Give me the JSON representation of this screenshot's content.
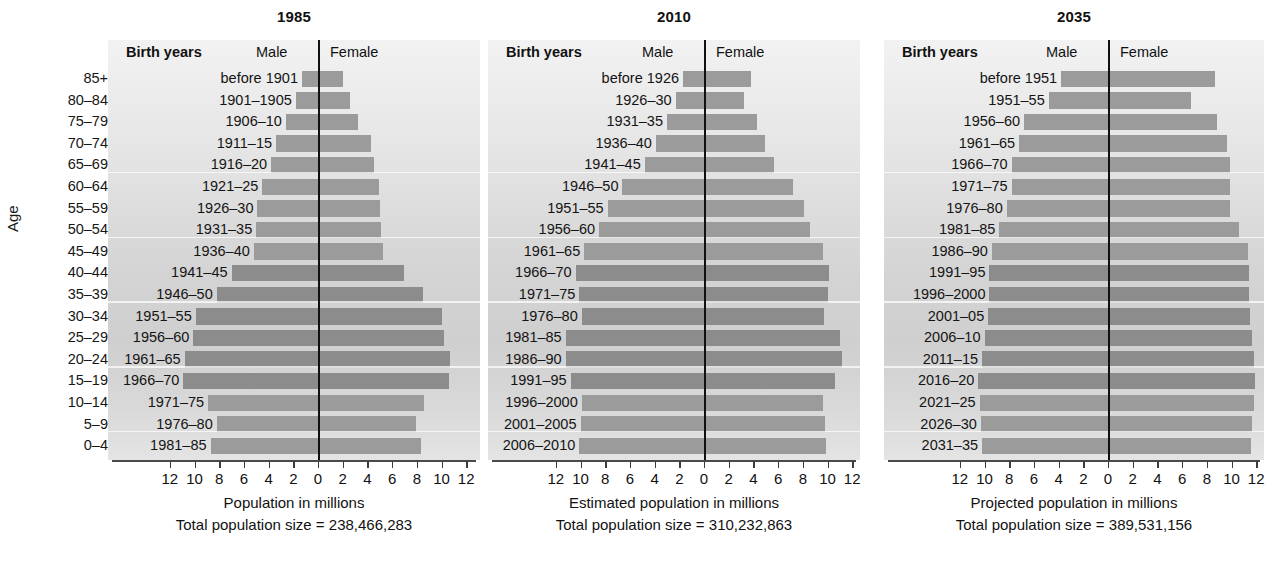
{
  "y_axis": {
    "title": "Age",
    "labels": [
      "85+",
      "80–84",
      "75–79",
      "70–74",
      "65–69",
      "60–64",
      "55–59",
      "50–54",
      "45–49",
      "40–44",
      "35–39",
      "30–34",
      "25–29",
      "20–24",
      "15–19",
      "10–14",
      "5–9",
      "0–4"
    ]
  },
  "common": {
    "birth_years_header": "Birth years",
    "male_header": "Male",
    "female_header": "Female",
    "tick_labels": [
      "12",
      "10",
      "8",
      "6",
      "4",
      "2",
      "0",
      "2",
      "4",
      "6",
      "8",
      "10",
      "12"
    ],
    "bar_color": "#9b9b9b",
    "bar_color_dark": "#8c8c8c",
    "zero_line_color": "#111111"
  },
  "chart_data": {
    "type": "bar",
    "ylabel": "Age",
    "grid": true,
    "legend": [
      "Male",
      "Female"
    ],
    "xlim": [
      -12,
      12
    ],
    "categories": [
      "85+",
      "80–84",
      "75–79",
      "70–74",
      "65–69",
      "60–64",
      "55–59",
      "50–54",
      "45–49",
      "40–44",
      "35–39",
      "30–34",
      "25–29",
      "20–24",
      "15–19",
      "10–14",
      "5–9",
      "0–4"
    ],
    "panels": [
      {
        "year": "1985",
        "xlabel": "Population in millions",
        "total_label": "Total population size = 238,466,283",
        "total_value": 238466283,
        "birth_years": [
          "before 1901",
          "1901–1905",
          "1906–10",
          "1911–15",
          "1916–20",
          "1921–25",
          "1926–30",
          "1931–35",
          "1936–40",
          "1941–45",
          "1946–50",
          "1951–55",
          "1956–60",
          "1961–65",
          "1966–70",
          "1971–75",
          "1976–80",
          "1981–85"
        ],
        "male": [
          1.3,
          1.8,
          2.6,
          3.4,
          3.8,
          4.5,
          4.9,
          5.0,
          5.2,
          7.0,
          8.2,
          9.9,
          10.1,
          10.8,
          10.9,
          8.9,
          8.2,
          8.7
        ],
        "female": [
          2.0,
          2.6,
          3.2,
          4.3,
          4.5,
          4.9,
          5.0,
          5.1,
          5.3,
          7.0,
          8.5,
          10.0,
          10.2,
          10.7,
          10.6,
          8.6,
          7.9,
          8.3
        ],
        "highlight_rows": [
          9,
          10,
          11,
          12,
          13,
          14
        ]
      },
      {
        "year": "2010",
        "xlabel": "Estimated population in millions",
        "total_label": "Total population size = 310,232,863",
        "total_value": 310232863,
        "birth_years": [
          "before 1926",
          "1926–30",
          "1931–35",
          "1936–40",
          "1941–45",
          "1946–50",
          "1951–55",
          "1956–60",
          "1961–65",
          "1966–70",
          "1971–75",
          "1976–80",
          "1981–85",
          "1986–90",
          "1991–95",
          "1996–2000",
          "2001–2005",
          "2006–2010"
        ],
        "male": [
          1.7,
          2.3,
          3.0,
          3.9,
          4.8,
          6.6,
          7.8,
          8.5,
          9.7,
          10.4,
          10.1,
          9.9,
          11.2,
          11.2,
          10.8,
          9.9,
          10.0,
          10.1
        ],
        "female": [
          3.8,
          3.2,
          4.3,
          4.9,
          5.7,
          7.2,
          8.1,
          8.6,
          9.6,
          10.1,
          10.0,
          9.7,
          11.0,
          11.2,
          10.6,
          9.6,
          9.8,
          9.9
        ],
        "highlight_rows": [
          9,
          10,
          11,
          12,
          13,
          14
        ]
      },
      {
        "year": "2035",
        "xlabel": "Projected population in millions",
        "total_label": "Total population size = 389,531,156",
        "total_value": 389531156,
        "birth_years": [
          "before 1951",
          "1951–55",
          "1956–60",
          "1961–65",
          "1966–70",
          "1971–75",
          "1976–80",
          "1981–85",
          "1986–90",
          "1991–95",
          "1996–2000",
          "2001–05",
          "2006–10",
          "2011–15",
          "2016–20",
          "2021–25",
          "2026–30",
          "2031–35"
        ],
        "male": [
          3.8,
          4.8,
          6.8,
          7.2,
          7.8,
          7.8,
          8.2,
          8.8,
          9.4,
          9.6,
          9.6,
          9.7,
          10.0,
          10.2,
          10.5,
          10.4,
          10.3,
          10.2
        ],
        "female": [
          8.7,
          6.7,
          8.8,
          9.6,
          9.9,
          9.9,
          9.9,
          10.6,
          11.3,
          11.4,
          11.4,
          11.5,
          11.7,
          11.8,
          11.9,
          11.8,
          11.7,
          11.6
        ],
        "highlight_rows": [
          9,
          10,
          11,
          12,
          13,
          14
        ]
      }
    ]
  }
}
